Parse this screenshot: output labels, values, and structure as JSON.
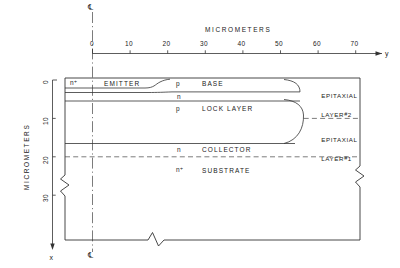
{
  "figure": {
    "type": "semiconductor-cross-section",
    "units_label": "MICROMETERS",
    "centerline_symbol": "℄",
    "axes": {
      "horizontal": {
        "variable": "y",
        "title": "MICROMETERS",
        "ticks": [
          "0",
          "10",
          "20",
          "30",
          "40",
          "50",
          "60",
          "70"
        ],
        "tick_values": [
          0,
          10,
          20,
          30,
          40,
          50,
          60,
          70
        ]
      },
      "vertical": {
        "variable": "x",
        "title": "MICROMETERS",
        "ticks": [
          "0",
          "10",
          "20",
          "30"
        ],
        "tick_values": [
          0,
          10,
          20,
          30
        ]
      }
    },
    "layers": [
      {
        "dopant": "n⁺",
        "name": "EMITTER"
      },
      {
        "dopant": "p",
        "name": "BASE"
      },
      {
        "dopant": "n",
        "name": ""
      },
      {
        "dopant": "p",
        "name": "LOCK LAYER"
      },
      {
        "dopant": "n",
        "name": "COLLECTOR"
      },
      {
        "dopant": "n⁺",
        "name": "SUBSTRATE"
      }
    ],
    "annotations": [
      {
        "line1": "EPITAXIAL",
        "line2": "LAYER",
        "hash": "#",
        "number": "2"
      },
      {
        "line1": "EPITAXIAL",
        "line2": "LAYER",
        "hash": "#",
        "number": "1"
      }
    ],
    "colors": {
      "ink": "#1a1a1a",
      "line": "#333333",
      "background": "#ffffff"
    }
  }
}
